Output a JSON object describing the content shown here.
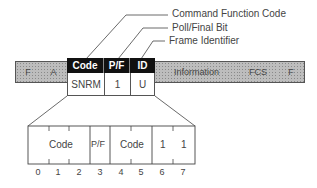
{
  "callouts": {
    "command_function_code": "Command Function Code",
    "poll_final_bit": "Poll/Final Bit",
    "frame_identifier": "Frame Identifier"
  },
  "frame": {
    "fields": [
      {
        "label": "F",
        "shaded": true
      },
      {
        "label": "A",
        "shaded": true
      },
      {
        "label": "Information",
        "shaded": true
      },
      {
        "label": "FCS",
        "shaded": true
      },
      {
        "label": "F",
        "shaded": true
      }
    ],
    "control": {
      "headers": [
        "Code",
        "P/F",
        "ID"
      ],
      "values": [
        "SNRM",
        "1",
        "U"
      ]
    }
  },
  "expanded": {
    "fields": [
      "Code",
      "P/F",
      "Code",
      "1",
      "1"
    ],
    "bits": [
      "0",
      "1",
      "2",
      "3",
      "4",
      "5",
      "6",
      "7"
    ]
  }
}
